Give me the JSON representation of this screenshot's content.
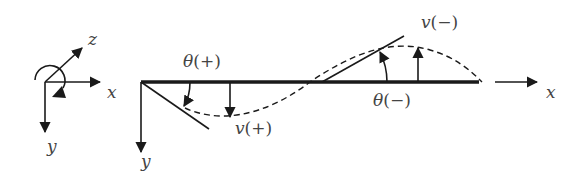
{
  "colors": {
    "ink": "#1a1a1a",
    "label": "#444444",
    "background": "#ffffff"
  },
  "coordinate_system": {
    "x_label": "x",
    "y_label": "y",
    "z_label": "z"
  },
  "beam": {
    "axis_x_label": "x",
    "axis_y_label": "y",
    "rotation_positive_symbol": "θ",
    "rotation_positive_sign": "(+)",
    "rotation_negative_symbol": "θ",
    "rotation_negative_sign": "(−)",
    "deflection_positive_symbol": "v",
    "deflection_positive_sign": "(+)",
    "deflection_negative_symbol": "v",
    "deflection_negative_sign": "(−)"
  }
}
